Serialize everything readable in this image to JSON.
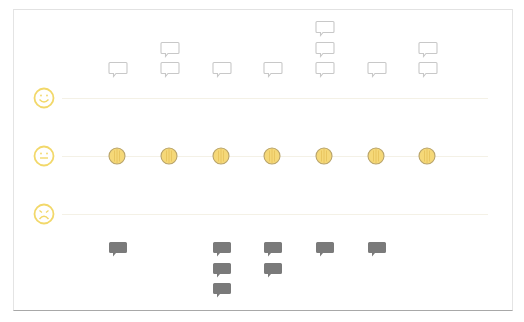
{
  "diagram": {
    "rows": [
      {
        "key": "positive",
        "icon": "smiley-happy-icon",
        "line_y": 98,
        "face_y": 87
      },
      {
        "key": "neutral",
        "icon": "smiley-neutral-icon",
        "line_y": 156,
        "face_y": 145
      },
      {
        "key": "negative",
        "icon": "smiley-sad-icon",
        "line_y": 214,
        "face_y": 203
      }
    ],
    "columns_x": [
      117,
      169,
      221,
      272,
      324,
      376,
      427
    ],
    "positive_comment_counts": [
      1,
      2,
      1,
      1,
      3,
      1,
      2
    ],
    "neutral_markers": [
      1,
      1,
      1,
      1,
      1,
      1,
      1
    ],
    "negative_comment_counts": [
      1,
      0,
      3,
      2,
      1,
      1,
      0
    ],
    "colors": {
      "face_stroke": "#f2d86a",
      "dot_fill": "#f5d878",
      "dot_stroke": "#b8a36a",
      "outline_bubble_stroke": "#c8c8c8",
      "filled_bubble": "#7a7a7a",
      "row_line": "#f4f1e6",
      "frame_border": "#e2e2e2"
    }
  }
}
